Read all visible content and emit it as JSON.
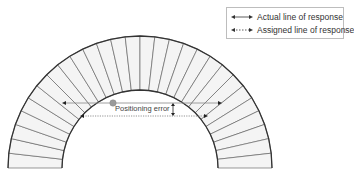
{
  "diagram": {
    "ring": {
      "center": [
        140,
        168
      ],
      "outer_radius": 132,
      "inner_radius": 78,
      "segments": 28,
      "fill": "#f4f4f4",
      "stroke": "#333333"
    },
    "actual_line": {
      "y": 103,
      "x1": 62,
      "x2": 222
    },
    "assigned_line": {
      "y": 116,
      "x1": 80,
      "x2": 208
    },
    "annihilation_point": {
      "x": 113,
      "y": 103,
      "color": "#9a9a9a"
    },
    "error_marker_x": 173,
    "annotation": "Positioning error"
  },
  "legend": {
    "items": [
      {
        "label": "Actual line of response",
        "style": "solid"
      },
      {
        "label": "Assigned line of response",
        "style": "dotted"
      }
    ]
  }
}
